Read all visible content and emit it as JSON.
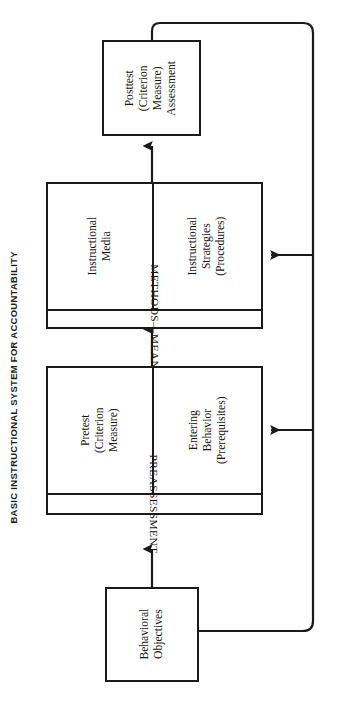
{
  "title": "BASIC INSTRUCTIONAL SYSTEM FOR ACCOUNTABILITY",
  "orientation": "rotated-90-ccw",
  "diagram": {
    "type": "flowchart",
    "boxes": {
      "posttest": {
        "label": "Posttest\n(Criterion\nMeasure)\nAssessment",
        "line1": "Posttest",
        "line2": "(Criterion",
        "line3": "Measure)",
        "line4": "Assessment"
      },
      "methods_means": {
        "band_label": "METHODS—MEANS",
        "cell_media": {
          "line1": "Instructional",
          "line2": "Media"
        },
        "cell_strategies": {
          "line1": "Instructional",
          "line2": "Strategies",
          "line3": "(Procedures)"
        }
      },
      "preassessment": {
        "band_label": "PREASSESSMENT",
        "cell_pretest": {
          "line1": "Pretest",
          "line2": "(Criterion",
          "line3": "Measure)"
        },
        "cell_entering": {
          "line1": "Entering",
          "line2": "Behavior",
          "line3": "(Prerequisites)"
        }
      },
      "behavioral_objectives": {
        "line1": "Behavioral",
        "line2": "Objectives"
      }
    },
    "flow_order": [
      "behavioral-objectives",
      "preassessment",
      "methods-means",
      "posttest"
    ],
    "feedback_loops": [
      "posttest-to-methods-means",
      "posttest-to-preassessment",
      "posttest-to-behavioral-objectives"
    ],
    "colors": {
      "stroke": "#1a1a1a",
      "background": "#ffffff",
      "text": "#141414"
    }
  }
}
